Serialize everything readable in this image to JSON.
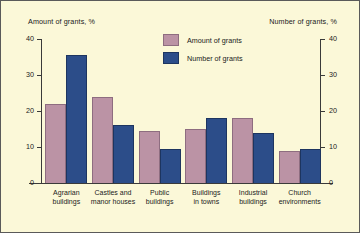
{
  "chart_data": {
    "type": "bar",
    "title": "",
    "categories": [
      "Agrarian buildings",
      "Castles and manor houses",
      "Public buildings",
      "Buildings in towns",
      "Industrial buildings",
      "Church environments"
    ],
    "category_lines": [
      [
        "Agrarian",
        "buildings"
      ],
      [
        "Castles and",
        "manor houses"
      ],
      [
        "Public",
        "buildings"
      ],
      [
        "Buildings",
        "in towns"
      ],
      [
        "Industrial",
        "buildings"
      ],
      [
        "Church",
        "environments"
      ]
    ],
    "series": [
      {
        "name": "Amount of grants",
        "color": "#bb93a5",
        "values": [
          22,
          24,
          14.5,
          15,
          18,
          9
        ]
      },
      {
        "name": "Number of grants",
        "color": "#2c4d89",
        "values": [
          35.5,
          16,
          9.5,
          18,
          14,
          9.5
        ]
      }
    ],
    "ylabel_left": "Amount of grants, %",
    "ylabel_right": "Number of grants, %",
    "xlabel": "",
    "ylim": [
      0,
      40
    ],
    "yticks": [
      0,
      10,
      20,
      30,
      40
    ],
    "ytick_labels": [
      "0",
      "10",
      "20",
      "30",
      "40"
    ],
    "ylim_right": [
      0,
      40
    ],
    "yticks_right": [
      0,
      10,
      20,
      30,
      40
    ],
    "ytick_labels_right": [
      "0",
      "10",
      "20",
      "30",
      "40"
    ],
    "grid": false,
    "legend_position": "upper center",
    "legend": [
      "Amount of grants",
      "Number of grants"
    ],
    "background_color": "#fbf8d8",
    "border_color": "#5a5a5a"
  }
}
